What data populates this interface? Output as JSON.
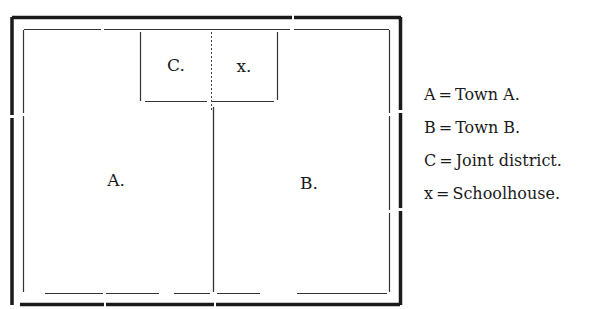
{
  "diagram": {
    "type": "district-map",
    "regions": [
      {
        "id": "A",
        "label": "A."
      },
      {
        "id": "B",
        "label": "B."
      },
      {
        "id": "C",
        "label": "C."
      },
      {
        "id": "x",
        "label": "x."
      }
    ]
  },
  "legend": {
    "equals": "=",
    "items": [
      {
        "key": "A",
        "description": "Town A."
      },
      {
        "key": "B",
        "description": "Town B."
      },
      {
        "key": "C",
        "description": "Joint district."
      },
      {
        "key": "x",
        "description": "Schoolhouse."
      }
    ]
  },
  "colors": {
    "ink": "#1a1a1a",
    "background": "#ffffff"
  }
}
